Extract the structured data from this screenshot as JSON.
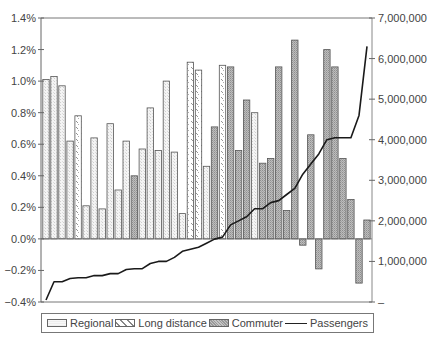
{
  "chart_data": {
    "type": "bar",
    "title": "",
    "xlabel": "",
    "ylabel": "",
    "y_left": {
      "ylim": [
        -0.4,
        1.4
      ],
      "ticks": [
        1.4,
        1.2,
        1.0,
        0.8,
        0.6,
        0.4,
        0.2,
        0.0,
        -0.2,
        -0.4
      ],
      "tick_labels": [
        "1.4%",
        "1.2%",
        "1.0%",
        "0.8%",
        "0.6%",
        "0.4%",
        "0.2%",
        "0.0%",
        "-0.2%",
        "-0.4%"
      ]
    },
    "y_right": {
      "ylim": [
        0,
        7000000
      ],
      "ticks": [
        7000000,
        6000000,
        5000000,
        4000000,
        3000000,
        2000000,
        1000000,
        0
      ],
      "tick_labels": [
        "7,000,000",
        "6,000,000",
        "5,000,000",
        "4,000,000",
        "3,000,000",
        "2,000,000",
        "1,000,000",
        "–"
      ]
    },
    "grid": false,
    "legend_position": "bottom",
    "legend": [
      "Regional",
      "Long distance",
      "Commuter",
      "Passengers"
    ],
    "bars": [
      {
        "type": "Regional",
        "value": 1.01
      },
      {
        "type": "Regional",
        "value": 1.03
      },
      {
        "type": "Regional",
        "value": 0.97
      },
      {
        "type": "Regional",
        "value": 0.62
      },
      {
        "type": "Long distance",
        "value": 0.78
      },
      {
        "type": "Regional",
        "value": 0.21
      },
      {
        "type": "Regional",
        "value": 0.64
      },
      {
        "type": "Regional",
        "value": 0.19
      },
      {
        "type": "Regional",
        "value": 0.73
      },
      {
        "type": "Regional",
        "value": 0.31
      },
      {
        "type": "Regional",
        "value": 0.62
      },
      {
        "type": "Commuter",
        "value": 0.4
      },
      {
        "type": "Regional",
        "value": 0.57
      },
      {
        "type": "Regional",
        "value": 0.83
      },
      {
        "type": "Regional",
        "value": 0.56
      },
      {
        "type": "Regional",
        "value": 1.0
      },
      {
        "type": "Regional",
        "value": 0.55
      },
      {
        "type": "Regional",
        "value": 0.16
      },
      {
        "type": "Long distance",
        "value": 1.12
      },
      {
        "type": "Long distance",
        "value": 1.07
      },
      {
        "type": "Regional",
        "value": 0.46
      },
      {
        "type": "Commuter",
        "value": 0.71
      },
      {
        "type": "Long distance",
        "value": 1.1
      },
      {
        "type": "Commuter",
        "value": 1.09
      },
      {
        "type": "Commuter",
        "value": 0.56
      },
      {
        "type": "Commuter",
        "value": 0.88
      },
      {
        "type": "Regional",
        "value": 0.8
      },
      {
        "type": "Commuter",
        "value": 0.48
      },
      {
        "type": "Commuter",
        "value": 0.51
      },
      {
        "type": "Commuter",
        "value": 1.09
      },
      {
        "type": "Commuter",
        "value": 0.18
      },
      {
        "type": "Commuter",
        "value": 1.26
      },
      {
        "type": "Commuter",
        "value": -0.04
      },
      {
        "type": "Commuter",
        "value": 0.66
      },
      {
        "type": "Commuter",
        "value": -0.19
      },
      {
        "type": "Commuter",
        "value": 1.2
      },
      {
        "type": "Commuter",
        "value": 1.09
      },
      {
        "type": "Commuter",
        "value": 0.51
      },
      {
        "type": "Commuter",
        "value": 0.25
      },
      {
        "type": "Commuter",
        "value": -0.28
      },
      {
        "type": "Commuter",
        "value": 0.12
      }
    ],
    "series": [
      {
        "name": "Passengers",
        "type": "line",
        "axis": "right",
        "values": [
          50000,
          500000,
          500000,
          580000,
          600000,
          600000,
          650000,
          650000,
          700000,
          700000,
          800000,
          820000,
          820000,
          950000,
          1000000,
          1000000,
          1100000,
          1250000,
          1300000,
          1350000,
          1450000,
          1550000,
          1600000,
          1900000,
          2000000,
          2100000,
          2300000,
          2300000,
          2450000,
          2500000,
          2650000,
          2800000,
          3150000,
          3400000,
          3650000,
          4000000,
          4050000,
          4050000,
          4050000,
          4600000,
          6300000
        ]
      }
    ]
  },
  "legend": {
    "regional": "Regional",
    "long_distance": "Long distance",
    "commuter": "Commuter",
    "passengers": "Passengers"
  }
}
